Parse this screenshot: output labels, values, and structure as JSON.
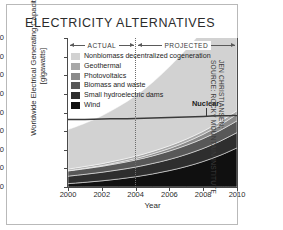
{
  "title": "ELECTRICITY ALTERNATIVES",
  "credit": "JEN CHRISTIANSEN;\nSOURCE: ROCKY MOUNTAIN INSTITUTE",
  "spans": [
    {
      "label": "ACTUAL",
      "from": 2000,
      "to": 2004
    },
    {
      "label": "PROJECTED",
      "from": 2004,
      "to": 2010
    }
  ],
  "divider_year": 2004,
  "annotation": {
    "label": "Nuclear",
    "year": 2007.3,
    "value": 385
  },
  "chart_data": {
    "type": "area",
    "title": "ELECTRICITY ALTERNATIVES",
    "xlabel": "Year",
    "ylabel": "Worldwide Electrical Generating Capacity [gigawatts]",
    "xlim": [
      2000,
      2010
    ],
    "ylim": [
      0,
      800
    ],
    "xticks": [
      2000,
      2002,
      2004,
      2006,
      2008,
      2010
    ],
    "yticks": [
      0,
      100,
      200,
      300,
      400,
      500,
      600,
      700,
      800
    ],
    "grid": false,
    "stacked": true,
    "legend_position": "upper-left-inside",
    "x": [
      2000,
      2001,
      2002,
      2003,
      2004,
      2005,
      2006,
      2007,
      2008,
      2009,
      2010
    ],
    "series": [
      {
        "name": "Wind",
        "color": "#101010",
        "values": [
          18,
          25,
          33,
          43,
          55,
          70,
          88,
          110,
          137,
          170,
          210
        ]
      },
      {
        "name": "Small hydroelectric dams",
        "color": "#2e2e2e",
        "values": [
          40,
          43,
          46,
          49,
          52,
          56,
          60,
          65,
          70,
          76,
          82
        ]
      },
      {
        "name": "Biomass and waste",
        "color": "#585858",
        "values": [
          28,
          30,
          32,
          35,
          38,
          41,
          45,
          49,
          53,
          58,
          63
        ]
      },
      {
        "name": "Photovoltaics",
        "color": "#8a8a8a",
        "values": [
          2,
          3,
          4,
          6,
          8,
          11,
          14,
          18,
          23,
          29,
          36
        ]
      },
      {
        "name": "Geothermal",
        "color": "#a8a8a8",
        "values": [
          8,
          9,
          10,
          11,
          12,
          13,
          14,
          15,
          16,
          18,
          19
        ]
      },
      {
        "name": "Nonbiomass decentralized cogeneration",
        "color": "#d2d2d2",
        "values": [
          212,
          232,
          257,
          288,
          325,
          370,
          424,
          483,
          546,
          613,
          680
        ]
      }
    ],
    "reference_band": {
      "name": "Nuclear",
      "color": "#3a3a3a",
      "lower": [
        358,
        359,
        361,
        362,
        364,
        366,
        369,
        372,
        375,
        378,
        380
      ],
      "upper": [
        366,
        367,
        369,
        370,
        372,
        374,
        377,
        380,
        383,
        386,
        388
      ]
    }
  }
}
